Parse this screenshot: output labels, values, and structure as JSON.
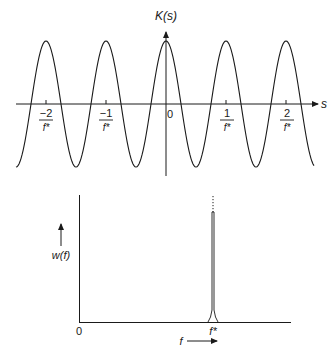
{
  "top_plot": {
    "y_label": "K(s)",
    "x_label": "s",
    "origin_label": "0",
    "ticks": [
      {
        "num": "−2",
        "den": "f*"
      },
      {
        "num": "−1",
        "den": "f*"
      },
      {
        "num": "1",
        "den": "f*"
      },
      {
        "num": "2",
        "den": "f*"
      }
    ]
  },
  "bottom_plot": {
    "y_label": "w(f)",
    "x_label": "f",
    "origin_label": "0",
    "peak_label": "f*"
  },
  "chart_data": [
    {
      "type": "line",
      "title": "",
      "xlabel": "s",
      "ylabel": "K(s)",
      "description": "Periodic cosine-like function K(s) with period 1/f*, maxima at s = n/f*",
      "x_ticks": [
        "-2/f*",
        "-1/f*",
        "0",
        "1/f*",
        "2/f*"
      ],
      "grid": false
    },
    {
      "type": "line",
      "title": "",
      "xlabel": "f",
      "ylabel": "w(f)",
      "description": "Spectral density w(f): a single very narrow spike (delta-like) at f = f*, zero elsewhere",
      "x_ticks": [
        "0",
        "f*"
      ],
      "grid": false
    }
  ]
}
